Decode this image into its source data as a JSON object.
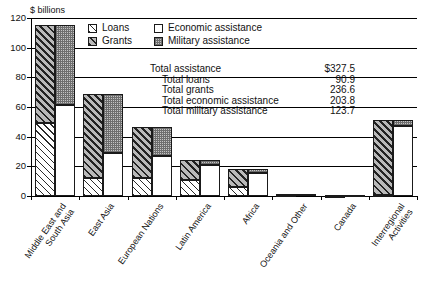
{
  "chart_data": {
    "type": "bar",
    "title": "",
    "subtitle": "",
    "unit_label": "$ billions",
    "xlabel": "",
    "ylabel": "$ billions",
    "ylim": [
      0,
      120
    ],
    "yticks": [
      0,
      20,
      40,
      60,
      80,
      100,
      120
    ],
    "grid": true,
    "legend_position": "top-center",
    "categories": [
      "Middle East and\nSouth Asia",
      "East Asia",
      "European Nations",
      "Latin America",
      "Africa",
      "Oceania and Other",
      "Canada",
      "Interregional\nActivities"
    ],
    "series": [
      {
        "name": "Loans",
        "stack": "type",
        "values": [
          49.5,
          12.0,
          12.0,
          11.0,
          6.0,
          0.4,
          0.2,
          1.0
        ]
      },
      {
        "name": "Grants",
        "stack": "type",
        "values": [
          65.5,
          56.5,
          34.5,
          13.5,
          12.5,
          1.2,
          0.5,
          50.5
        ]
      },
      {
        "name": "Economic assistance",
        "stack": "purpose",
        "values": [
          61.5,
          29.0,
          27.0,
          21.0,
          15.5,
          1.6,
          0.6,
          47.0
        ]
      },
      {
        "name": "Military assistance",
        "stack": "purpose",
        "values": [
          53.5,
          39.5,
          19.5,
          3.5,
          3.0,
          0.0,
          0.1,
          4.5
        ]
      }
    ],
    "category_totals": [
      115.0,
      68.5,
      46.5,
      24.5,
      18.5,
      1.6,
      0.7,
      51.5
    ]
  },
  "legend": {
    "items": [
      {
        "label": "Loans",
        "pattern": "diagonal-hatch-light",
        "order": 1
      },
      {
        "label": "Economic assistance",
        "pattern": "solid-white",
        "order": 2
      },
      {
        "label": "Grants",
        "pattern": "diagonal-hatch-dark",
        "order": 3
      },
      {
        "label": "Military assistance",
        "pattern": "dotted-gray",
        "order": 4
      }
    ]
  },
  "totals": {
    "rows": [
      {
        "label": "Total assistance",
        "value": "$327.5",
        "indent": false
      },
      {
        "label": "Total loans",
        "value": "90.9",
        "indent": true
      },
      {
        "label": "Total grants",
        "value": "236.6",
        "indent": true
      },
      {
        "label": "Total economic assistance",
        "value": "203.8",
        "indent": true
      },
      {
        "label": "Total military assistance",
        "value": "123.7",
        "indent": true
      }
    ]
  },
  "axis": {
    "ytick_labels": [
      "120",
      "100",
      "80",
      "60",
      "40",
      "20",
      "0"
    ]
  },
  "colors": {
    "ink": "#111111",
    "grid": "#000000",
    "grants_fill": "#b9b9b9",
    "military_fill": "#c4c4c4",
    "economic_fill": "#ffffff"
  }
}
